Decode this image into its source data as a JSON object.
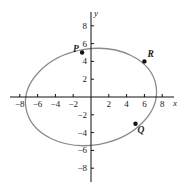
{
  "diagram": {
    "type": "ellipse-on-coordinate-plane",
    "axes": {
      "x_label": "x",
      "y_label": "y",
      "x_ticks": [
        {
          "value": -8,
          "label": "-8"
        },
        {
          "value": -6,
          "label": "-6"
        },
        {
          "value": -4,
          "label": "-4"
        },
        {
          "value": -2,
          "label": "-2"
        },
        {
          "value": 2,
          "label": "2"
        },
        {
          "value": 4,
          "label": "4"
        },
        {
          "value": 6,
          "label": "6"
        },
        {
          "value": 8,
          "label": "8"
        }
      ],
      "y_ticks": [
        {
          "value": 8,
          "label": "8"
        },
        {
          "value": 6,
          "label": "6"
        },
        {
          "value": 4,
          "label": "4"
        },
        {
          "value": 2,
          "label": "2"
        },
        {
          "value": -2,
          "label": "-2"
        },
        {
          "value": -4,
          "label": "-4"
        },
        {
          "value": -6,
          "label": "-6"
        },
        {
          "value": -8,
          "label": "-8"
        }
      ]
    },
    "ellipse": {
      "center": [
        0,
        0
      ],
      "semi_major": 7.4,
      "semi_minor": 5.3,
      "rotation_deg": 10,
      "stroke": "#8a8a8a"
    },
    "points": [
      {
        "name": "P",
        "label": "P",
        "x": -1,
        "y": 5
      },
      {
        "name": "R",
        "label": "R",
        "x": 6,
        "y": 4
      },
      {
        "name": "Q",
        "label": "Q",
        "x": 5,
        "y": -3
      }
    ]
  }
}
